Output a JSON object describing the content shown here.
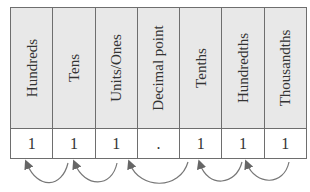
{
  "columns": [
    {
      "header": "Hundreds",
      "value": "1"
    },
    {
      "header": "Tens",
      "value": "1"
    },
    {
      "header": "Units/Ones",
      "value": "1"
    },
    {
      "header": "Decimal point",
      "value": "."
    },
    {
      "header": "Tenths",
      "value": "1"
    },
    {
      "header": "Hundredths",
      "value": "1"
    },
    {
      "header": "Thousandths",
      "value": "1"
    }
  ],
  "arrows": [
    {
      "from": "Tens",
      "to": "Hundreds"
    },
    {
      "from": "Units/Ones",
      "to": "Tens"
    },
    {
      "from": "Tenths",
      "to": "Units/Ones"
    },
    {
      "from": "Hundredths",
      "to": "Tenths"
    },
    {
      "from": "Thousandths",
      "to": "Hundredths"
    }
  ],
  "colors": {
    "header_bg": "#e8e8e8",
    "border": "#6e6e6e",
    "arrow": "#666666"
  }
}
